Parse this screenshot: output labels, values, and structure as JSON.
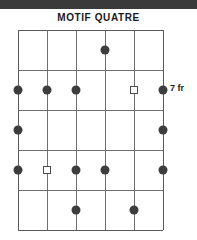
{
  "top_band": {
    "text": "",
    "color": "#3a3a3a"
  },
  "title": "MOTIF QUATRE",
  "diagram": {
    "type": "guitar-fretboard",
    "strings": 6,
    "frets": 5,
    "position_label": "7 fr",
    "line_color": "#6e6e6e",
    "dot_color": "#3d3d3d",
    "open_marker_color": "#4a4a4a",
    "markers": [
      {
        "string": 4,
        "fret": 1,
        "type": "filled"
      },
      {
        "string": 1,
        "fret": 2,
        "type": "filled"
      },
      {
        "string": 2,
        "fret": 2,
        "type": "filled"
      },
      {
        "string": 3,
        "fret": 2,
        "type": "filled"
      },
      {
        "string": 5,
        "fret": 2,
        "type": "open"
      },
      {
        "string": 6,
        "fret": 2,
        "type": "filled"
      },
      {
        "string": 1,
        "fret": 3,
        "type": "filled"
      },
      {
        "string": 6,
        "fret": 3,
        "type": "filled"
      },
      {
        "string": 1,
        "fret": 4,
        "type": "filled"
      },
      {
        "string": 2,
        "fret": 4,
        "type": "open"
      },
      {
        "string": 3,
        "fret": 4,
        "type": "filled"
      },
      {
        "string": 4,
        "fret": 4,
        "type": "filled"
      },
      {
        "string": 6,
        "fret": 4,
        "type": "filled"
      },
      {
        "string": 3,
        "fret": 5,
        "type": "filled"
      },
      {
        "string": 5,
        "fret": 5,
        "type": "filled"
      }
    ]
  }
}
